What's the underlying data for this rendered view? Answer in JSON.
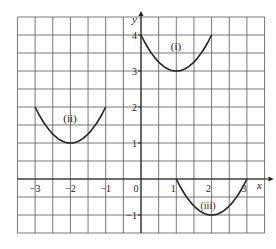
{
  "chart_data": {
    "type": "line",
    "title": "",
    "xlabel": "x",
    "ylabel": "y",
    "xlim": [
      -3.5,
      3.5
    ],
    "ylim": [
      -1.5,
      4.5
    ],
    "grid": true,
    "grid_step": 0.5,
    "x_ticks": [
      -3,
      -2,
      -1,
      0,
      1,
      2,
      3
    ],
    "x_tick_labels": [
      "−3",
      "−2",
      "−1",
      "0",
      "1",
      "2",
      "3"
    ],
    "y_ticks": [
      4,
      3,
      2,
      1,
      -1
    ],
    "y_tick_labels": [
      "4",
      "3",
      "2",
      "1",
      "−1"
    ],
    "series": [
      {
        "name": "(i)",
        "equation": "y = (x-1)^2 + 3",
        "vertex": [
          1,
          3
        ],
        "x_range": [
          0,
          2
        ]
      },
      {
        "name": "(ii)",
        "equation": "y = (x+2)^2 + 1",
        "vertex": [
          -2,
          1
        ],
        "x_range": [
          -3,
          -1
        ]
      },
      {
        "name": "(iii)",
        "equation": "y = (x-2)^2 - 1",
        "vertex": [
          2,
          -1
        ],
        "x_range": [
          1,
          3
        ]
      }
    ]
  },
  "labels": {
    "curve_i": "(i)",
    "curve_ii": "(ii)",
    "curve_iii": "(iii)",
    "axis_x": "x",
    "axis_y": "y",
    "origin": "0"
  }
}
